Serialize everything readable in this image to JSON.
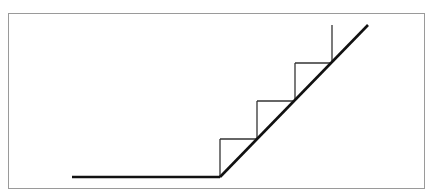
{
  "diagram": {
    "type": "staircase-ramp",
    "colors": {
      "line": "#111111",
      "border": "#9a9a9a",
      "background": "#ffffff"
    },
    "ground_line": {
      "x1": 72,
      "y1": 177,
      "x2": 220,
      "y2": 177
    },
    "ramp_line": {
      "x1": 220,
      "y1": 177,
      "x2": 368,
      "y2": 25
    },
    "steps": [
      {
        "riser_x": 220,
        "y_bottom": 177,
        "y_top": 139,
        "tread_x2": 257
      },
      {
        "riser_x": 257,
        "y_bottom": 139,
        "y_top": 101,
        "tread_x2": 295
      },
      {
        "riser_x": 295,
        "y_bottom": 101,
        "y_top": 63,
        "tread_x2": 332
      },
      {
        "riser_x": 332,
        "y_bottom": 63,
        "y_top": 25,
        "tread_x2": null
      }
    ]
  }
}
